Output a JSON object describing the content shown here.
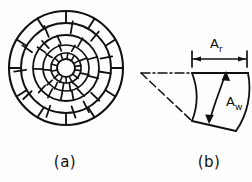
{
  "figure": {
    "background_color": "#fefefe",
    "ink_color": "#111111",
    "width": 252,
    "height": 182,
    "panels": [
      {
        "id": "panel-a",
        "caption": "(a)",
        "kind": "polar-spiral-mesh-disk",
        "description": "Circular disk discretized into a polar mesh of concentric rings and radial spokes with a small open hole at the centre",
        "center": {
          "x": 66,
          "y": 68
        },
        "outer_radius": 57,
        "ring_radii": [
          57,
          45,
          33,
          23,
          15
        ],
        "hole_radius": 9,
        "ring_count": 5,
        "spokes_per_ring": [
          12,
          12,
          12,
          12,
          16
        ],
        "spiral_offset_deg": 7
      },
      {
        "id": "panel-b",
        "caption": "(b)",
        "kind": "single-mesh-cell-detail",
        "description": "Enlarged detail of one curved quadrilateral mesh element with radial dimension A_r and circumferential dimension A_w",
        "apex": {
          "x": 140,
          "y": 73
        },
        "centerline_style": "dash-dot",
        "lower_ray_style": "dashed",
        "dimension_line": {
          "name": "A_r",
          "y": 59,
          "x_start": 192,
          "x_end": 246,
          "arrow_style": "inward-double-arrow-with-end-ticks"
        },
        "cell_arrow": {
          "name": "A_w",
          "style": "double-headed",
          "from": {
            "x": 209,
            "y": 122
          },
          "to": {
            "x": 226,
            "y": 73
          }
        }
      }
    ],
    "labels": {
      "a_r": {
        "base": "A",
        "subscript": "r",
        "full": "Ar"
      },
      "a_w": {
        "base": "A",
        "subscript": "w",
        "full": "Aw"
      }
    },
    "captions": {
      "panel_a": "(a)",
      "panel_b": "(b)"
    }
  }
}
